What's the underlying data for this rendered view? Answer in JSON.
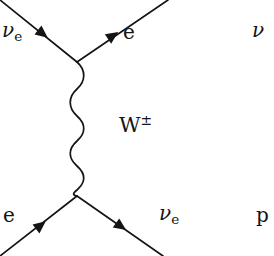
{
  "figure": {
    "kind": "feynman-diagram",
    "process": "charged-current neutrino-electron scattering",
    "background_color": "#ffffff",
    "stroke_color": "#141414"
  },
  "labels": {
    "incoming_neutrino": {
      "symbol": "ν",
      "subscript": "e"
    },
    "outgoing_electron": {
      "symbol": "e"
    },
    "exchanged_boson": {
      "symbol": "W",
      "superscript": "±"
    },
    "incoming_electron": {
      "symbol": "e"
    },
    "outgoing_neutrino": {
      "symbol": "ν",
      "subscript": "e"
    },
    "edge_clipped_neutrino": {
      "symbol": "ν"
    },
    "edge_clipped_proton": {
      "symbol": "p"
    }
  },
  "geometry": {
    "vertex_top": {
      "x": 77,
      "y": 62
    },
    "vertex_bottom": {
      "x": 77,
      "y": 196
    },
    "lines": [
      {
        "name": "incoming-neutrino-line",
        "x1": 0,
        "y1": 0,
        "x2": 77,
        "y2": 62,
        "arrow_at": {
          "x": 38,
          "y": 30
        },
        "arrow_angle": 38
      },
      {
        "name": "outgoing-electron-line",
        "x1": 77,
        "y1": 62,
        "x2": 168,
        "y2": 0,
        "arrow_at": {
          "x": 113,
          "y": 37
        },
        "arrow_angle": -34
      },
      {
        "name": "incoming-electron-line",
        "x1": 0,
        "y1": 256,
        "x2": 77,
        "y2": 196,
        "arrow_at": {
          "x": 40,
          "y": 226
        },
        "arrow_angle": -38
      },
      {
        "name": "outgoing-neutrino-line",
        "x1": 77,
        "y1": 196,
        "x2": 163,
        "y2": 256,
        "arrow_at": {
          "x": 122,
          "y": 227
        },
        "arrow_angle": 35
      }
    ],
    "propagator": {
      "name": "w-boson-wavy-propagator",
      "x_center": 77,
      "y_start": 62,
      "y_end": 196,
      "amplitude": 7,
      "oscillations": 6
    }
  }
}
